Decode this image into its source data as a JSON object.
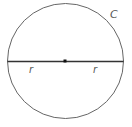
{
  "diagram": {
    "type": "circle-with-diameter",
    "circle_label": "C",
    "radius_labels": [
      "r",
      "r"
    ],
    "center_point": "center-dot",
    "colors": {
      "stroke": "#555555",
      "diameter": "#333333",
      "center": "#111111",
      "background": "#ffffff"
    }
  }
}
